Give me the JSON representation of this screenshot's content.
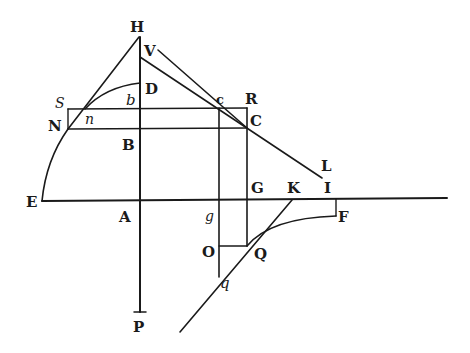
{
  "figure": {
    "labels": {
      "H": "H",
      "V": "V",
      "D": "D",
      "b": "b",
      "c": "c",
      "R": "R",
      "C": "C",
      "S": "S",
      "N": "N",
      "n": "n",
      "B": "B",
      "L": "L",
      "E": "E",
      "A": "A",
      "g": "g",
      "G": "G",
      "K": "K",
      "I": "I",
      "F": "F",
      "O": "O",
      "Q": "Q",
      "q": "q",
      "P": "P"
    }
  }
}
